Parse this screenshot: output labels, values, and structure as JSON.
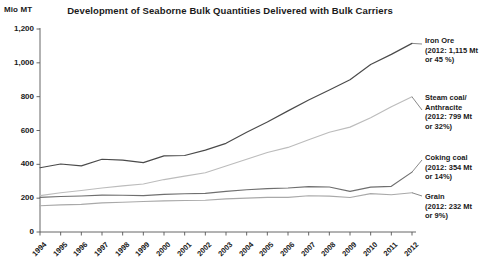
{
  "chart_data": {
    "type": "line",
    "title": "Development of Seaborne Bulk Quantities Delivered with Bulk Carriers",
    "xlabel": "",
    "ylabel": "Mio MT",
    "ylim": [
      0,
      1200
    ],
    "yticks": [
      "0",
      "200",
      "400",
      "600",
      "800",
      "1,000",
      "1,200"
    ],
    "ytick_values": [
      0,
      200,
      400,
      600,
      800,
      1000,
      1200
    ],
    "grid": false,
    "legend_position": "right-annotations",
    "categories": [
      "1994",
      "1995",
      "1996",
      "1997",
      "1998",
      "1999",
      "2000",
      "2001",
      "2002",
      "2003",
      "2004",
      "2005",
      "2006",
      "2007",
      "2008",
      "2009",
      "2010",
      "2011",
      "2012"
    ],
    "series": [
      {
        "name": "Iron Ore",
        "color": "#4a4a4a",
        "values": [
          380,
          402,
          391,
          430,
          425,
          410,
          450,
          452,
          484,
          524,
          589,
          650,
          716,
          780,
          840,
          900,
          990,
          1050,
          1115
        ]
      },
      {
        "name": "Steam coal/Anthracite",
        "color": "#bcbcbc",
        "values": [
          215,
          232,
          245,
          260,
          273,
          284,
          310,
          330,
          350,
          390,
          430,
          470,
          500,
          545,
          590,
          620,
          675,
          740,
          799
        ]
      },
      {
        "name": "Coking coal",
        "color": "#6f6f6f",
        "values": [
          205,
          210,
          213,
          218,
          217,
          215,
          222,
          226,
          228,
          240,
          250,
          256,
          260,
          268,
          266,
          240,
          265,
          270,
          354
        ]
      },
      {
        "name": "Grain",
        "color": "#a9a9a9",
        "values": [
          155,
          160,
          163,
          172,
          176,
          180,
          184,
          186,
          188,
          196,
          200,
          205,
          205,
          214,
          212,
          204,
          227,
          220,
          232
        ]
      }
    ],
    "annotations": [
      {
        "id": "iron-ore",
        "lines": [
          "Iron Ore",
          "(2012: 1,115 Mt",
          "or 45 %)"
        ],
        "series": "Iron Ore"
      },
      {
        "id": "steam-coal",
        "lines": [
          "Steam coal/",
          "Anthracite",
          "(2012: 799 Mt",
          "or 32%)"
        ],
        "series": "Steam coal/Anthracite"
      },
      {
        "id": "coking-coal",
        "lines": [
          "Coking coal",
          "(2012: 354 Mt",
          "or 14%)"
        ],
        "series": "Coking coal"
      },
      {
        "id": "grain",
        "lines": [
          "Grain",
          "(2012: 232 Mt",
          "or 9%)"
        ],
        "series": "Grain"
      }
    ]
  },
  "axis": {
    "unit_label": "Mio MT"
  },
  "annotation_text": {
    "iron_ore_l1": "Iron Ore",
    "iron_ore_l2": "(2012: 1,115 Mt",
    "iron_ore_l3": "or 45 %)",
    "steam_l1": "Steam coal/",
    "steam_l2": "Anthracite",
    "steam_l3": "(2012: 799 Mt",
    "steam_l4": "or 32%)",
    "coking_l1": "Coking coal",
    "coking_l2": "(2012: 354 Mt",
    "coking_l3": "or 14%)",
    "grain_l1": "Grain",
    "grain_l2": "(2012: 232 Mt",
    "grain_l3": "or 9%)"
  }
}
